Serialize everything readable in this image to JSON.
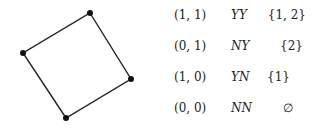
{
  "diagram": {
    "square": {
      "vertices": [
        [
          90,
          13
        ],
        [
          131,
          79
        ],
        [
          66,
          118
        ],
        [
          23,
          53
        ]
      ],
      "stroke": "#222222"
    },
    "rows": [
      {
        "coord": "(1, 1)",
        "code": "YY",
        "set": "{1, 2}"
      },
      {
        "coord": "(0, 1)",
        "code": "NY",
        "set": "{2}"
      },
      {
        "coord": "(1, 0)",
        "code": "YN",
        "set": "{1}"
      },
      {
        "coord": "(0, 0)",
        "code": "NN",
        "set": "∅"
      }
    ]
  }
}
